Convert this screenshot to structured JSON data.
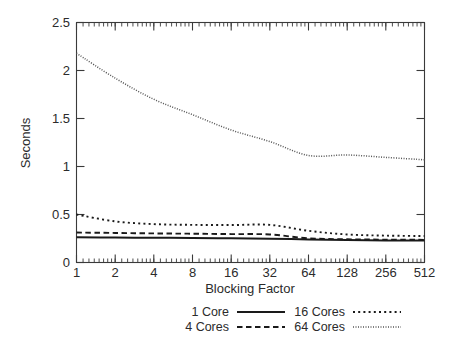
{
  "chart_data": {
    "type": "line",
    "title": "",
    "xlabel": "Blocking Factor",
    "ylabel": "Seconds",
    "xscale": "log2",
    "xlim": [
      1,
      512
    ],
    "ylim": [
      0,
      2.5
    ],
    "yticks": [
      "0",
      "0.5",
      "1",
      "1.5",
      "2",
      "2.5"
    ],
    "ytick_values": [
      0,
      0.5,
      1,
      1.5,
      2,
      2.5
    ],
    "xticks": [
      "1",
      "2",
      "4",
      "8",
      "16",
      "32",
      "64",
      "128",
      "256",
      "512"
    ],
    "xtick_values": [
      1,
      2,
      4,
      8,
      16,
      32,
      64,
      128,
      256,
      512
    ],
    "grid": false,
    "legend_position": "below",
    "x": [
      1,
      2,
      4,
      8,
      16,
      32,
      64,
      128,
      256,
      512
    ],
    "series": [
      {
        "name": "1 Core",
        "style": "solid",
        "color": "#1a1a1a",
        "values": [
          0.262,
          0.26,
          0.258,
          0.256,
          0.252,
          0.248,
          0.24,
          0.234,
          0.23,
          0.228
        ]
      },
      {
        "name": "4 Cores",
        "style": "dashed",
        "color": "#1a1a1a",
        "values": [
          0.312,
          0.308,
          0.303,
          0.3,
          0.296,
          0.292,
          0.252,
          0.242,
          0.238,
          0.236
        ]
      },
      {
        "name": "16 Cores",
        "style": "dotted",
        "color": "#1a1a1a",
        "values": [
          0.5,
          0.428,
          0.4,
          0.392,
          0.39,
          0.392,
          0.33,
          0.292,
          0.28,
          0.276
        ]
      },
      {
        "name": "64 Cores",
        "style": "fine-dotted",
        "color": "#555555",
        "values": [
          2.18,
          1.92,
          1.7,
          1.54,
          1.38,
          1.26,
          1.115,
          1.12,
          1.095,
          1.07
        ]
      }
    ]
  },
  "legend": {
    "entries": [
      {
        "label": "1 Core",
        "style": "solid"
      },
      {
        "label": "16 Cores",
        "style": "dotted"
      },
      {
        "label": "4 Cores",
        "style": "dashed"
      },
      {
        "label": "64 Cores",
        "style": "fine-dotted"
      }
    ]
  }
}
